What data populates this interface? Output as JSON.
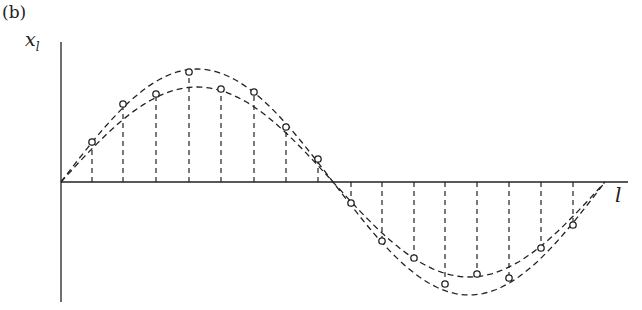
{
  "figure": {
    "panel_label": "(b)",
    "y_axis_label_main": "x",
    "y_axis_label_sub": "l",
    "x_axis_label": "l"
  },
  "chart_data": {
    "type": "line",
    "title": "",
    "xlabel": "l",
    "ylabel": "x_l",
    "grid": false,
    "legend": "none",
    "axis_pixels": {
      "origin_x": 61,
      "origin_y": 182,
      "x_end": 628,
      "y_top": 42,
      "y_bottom": 302
    },
    "curves": [
      {
        "name": "outer",
        "amplitude_px": 113,
        "x_start": 61,
        "x_end": 605
      },
      {
        "name": "inner",
        "amplitude_px": 95,
        "x_start": 61,
        "x_end": 605
      }
    ],
    "samples": [
      {
        "x": 92,
        "y": 142,
        "curve": "inner"
      },
      {
        "x": 123,
        "y": 104,
        "curve": "outer"
      },
      {
        "x": 156,
        "y": 94,
        "curve": "inner"
      },
      {
        "x": 189,
        "y": 72,
        "curve": "outer"
      },
      {
        "x": 221,
        "y": 89,
        "curve": "inner"
      },
      {
        "x": 254,
        "y": 92,
        "curve": "outer"
      },
      {
        "x": 286,
        "y": 127,
        "curve": "inner"
      },
      {
        "x": 318,
        "y": 159,
        "curve": "outer"
      },
      {
        "x": 351,
        "y": 203,
        "curve": "inner"
      },
      {
        "x": 382,
        "y": 241,
        "curve": "outer"
      },
      {
        "x": 414,
        "y": 258,
        "curve": "inner"
      },
      {
        "x": 445,
        "y": 284,
        "curve": "outer"
      },
      {
        "x": 477,
        "y": 274,
        "curve": "inner"
      },
      {
        "x": 509,
        "y": 278,
        "curve": "outer"
      },
      {
        "x": 541,
        "y": 248,
        "curve": "inner"
      },
      {
        "x": 573,
        "y": 225,
        "curve": "outer"
      }
    ]
  },
  "colors": {
    "ink": "#222222",
    "background": "#ffffff"
  }
}
